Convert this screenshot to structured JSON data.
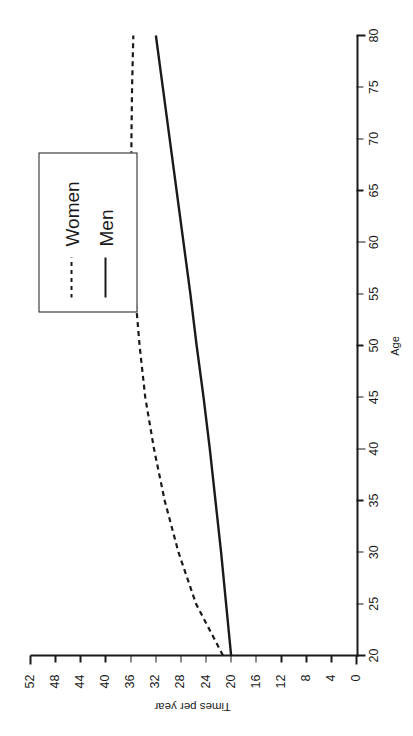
{
  "chart_data": {
    "type": "line",
    "title": "",
    "xlabel": "Age",
    "ylabel": "Times per year",
    "xlim": [
      20,
      80
    ],
    "ylim": [
      0,
      52
    ],
    "xticks": [
      20,
      25,
      30,
      35,
      40,
      45,
      50,
      55,
      60,
      65,
      70,
      75,
      80
    ],
    "yticks": [
      0,
      4,
      8,
      12,
      16,
      20,
      24,
      28,
      32,
      36,
      40,
      44,
      48,
      52
    ],
    "grid": false,
    "legend_position": "upper right",
    "x": [
      20,
      25,
      30,
      35,
      40,
      45,
      50,
      55,
      60,
      65,
      70,
      75,
      80
    ],
    "series": [
      {
        "name": "Women",
        "style": "dashed",
        "color": "#1a1a1a",
        "values": [
          21.3,
          25.6,
          28.4,
          30.6,
          32.3,
          33.7,
          34.6,
          35.3,
          35.7,
          35.9,
          35.9,
          35.8,
          35.6
        ]
      },
      {
        "name": "Men",
        "style": "solid",
        "color": "#1a1a1a",
        "values": [
          20.0,
          20.8,
          21.6,
          22.5,
          23.4,
          24.4,
          25.5,
          26.5,
          27.6,
          28.7,
          29.8,
          30.9,
          32.0
        ]
      }
    ]
  },
  "axes": {
    "x_axis_name": "Age",
    "y_axis_name": "Times per year",
    "x_tick_labels": [
      "20",
      "25",
      "30",
      "35",
      "40",
      "45",
      "50",
      "55",
      "60",
      "65",
      "70",
      "75",
      "80"
    ],
    "y_tick_labels": [
      "0",
      "4",
      "8",
      "12",
      "16",
      "20",
      "24",
      "28",
      "32",
      "36",
      "40",
      "44",
      "48",
      "52"
    ]
  },
  "legend": {
    "entries": [
      {
        "label": "Women",
        "style": "dashed"
      },
      {
        "label": "Men",
        "style": "solid"
      }
    ]
  },
  "colors": {
    "line": "#1a1a1a",
    "background": "#ffffff",
    "axis": "#1a1a1a"
  }
}
